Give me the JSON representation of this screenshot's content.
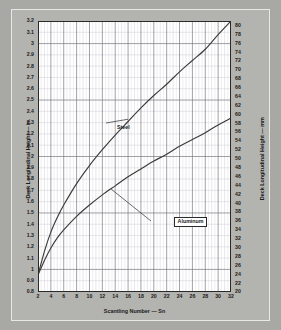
{
  "chart_data": {
    "type": "line",
    "title": "",
    "xlabel": "Scantling Number — Sn",
    "ylabel": "Deck Longitudinal Height — in.",
    "ylabel_right": "Deck Longitudinal Height — mm",
    "xlim": [
      2,
      32
    ],
    "ylim": [
      0.8,
      3.2
    ],
    "ylim_right": [
      20,
      81
    ],
    "grid": true,
    "legend_position": "inline-annotations",
    "xticks": [
      2,
      4,
      6,
      8,
      10,
      12,
      14,
      16,
      18,
      20,
      22,
      24,
      26,
      28,
      30,
      32
    ],
    "xminor_step": 1,
    "yticks": [
      0.8,
      0.9,
      1,
      1.1,
      1.2,
      1.3,
      1.4,
      1.5,
      1.6,
      1.7,
      1.8,
      1.9,
      2,
      2.1,
      2.2,
      2.3,
      2.4,
      2.5,
      2.6,
      2.7,
      2.8,
      2.9,
      3,
      3.1,
      3.2
    ],
    "yticks_right": [
      20,
      22,
      24,
      26,
      28,
      30,
      32,
      34,
      36,
      38,
      40,
      42,
      44,
      46,
      48,
      50,
      52,
      54,
      56,
      58,
      60,
      62,
      64,
      66,
      68,
      70,
      72,
      74,
      76,
      78,
      80
    ],
    "series": [
      {
        "name": "Steel",
        "color": "#3b3b3b",
        "x": [
          2,
          3,
          4,
          5,
          6,
          8,
          10,
          12,
          14,
          16,
          18,
          20,
          22,
          24,
          26,
          28,
          30,
          32
        ],
        "values": [
          0.95,
          1.16,
          1.33,
          1.46,
          1.57,
          1.76,
          1.92,
          2.06,
          2.19,
          2.31,
          2.43,
          2.54,
          2.64,
          2.75,
          2.85,
          2.95,
          3.08,
          3.2
        ]
      },
      {
        "name": "Aluminum",
        "color": "#3b3b3b",
        "x": [
          2,
          3,
          4,
          5,
          6,
          8,
          10,
          12,
          14,
          16,
          18,
          20,
          22,
          24,
          26,
          28,
          30,
          32
        ],
        "values": [
          0.95,
          1.08,
          1.19,
          1.28,
          1.35,
          1.47,
          1.57,
          1.66,
          1.74,
          1.82,
          1.89,
          1.96,
          2.02,
          2.09,
          2.15,
          2.21,
          2.28,
          2.34
        ]
      }
    ],
    "annotations": [
      {
        "text": "Steel",
        "boxed": false
      },
      {
        "text": "Aluminum",
        "boxed": true
      }
    ]
  },
  "colors": {
    "page_background": "#a8a8a4",
    "figure_background": "#b3b3af",
    "plot_background": "#ffffff",
    "curve": "#3b3b3b",
    "major_grid": "#6e6e76",
    "minor_grid": "#c9c9d2",
    "axis_border": "#2a2a2a",
    "text": "#1a1a1a"
  }
}
